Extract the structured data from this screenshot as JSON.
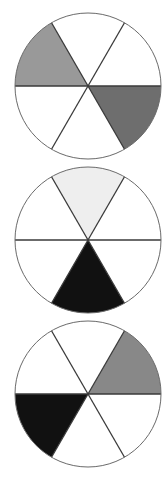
{
  "diagram": {
    "type": "sector-wheels",
    "sectors_per_wheel": 6,
    "sector_order_note": "sectors indexed clockwise starting at the 0-60deg wedge above the right horizontal radius (angles measured counter-clockwise from +x)",
    "stroke_color": "#3a3a3a",
    "outline_color": "#6a6a6a",
    "wheels": [
      {
        "id": "wheel-1",
        "center": [
          88,
          86
        ],
        "radius": 73,
        "sectors": [
          {
            "start": 0,
            "end": 60,
            "fill": "#ffffff"
          },
          {
            "start": 60,
            "end": 120,
            "fill": "#ffffff"
          },
          {
            "start": 120,
            "end": 180,
            "fill": "#999999"
          },
          {
            "start": 180,
            "end": 240,
            "fill": "#ffffff"
          },
          {
            "start": 240,
            "end": 300,
            "fill": "#ffffff"
          },
          {
            "start": 300,
            "end": 360,
            "fill": "#6e6e6e"
          }
        ]
      },
      {
        "id": "wheel-2",
        "center": [
          88,
          240
        ],
        "radius": 73,
        "sectors": [
          {
            "start": 0,
            "end": 60,
            "fill": "#ffffff"
          },
          {
            "start": 60,
            "end": 120,
            "fill": "#eeeeee"
          },
          {
            "start": 120,
            "end": 180,
            "fill": "#ffffff"
          },
          {
            "start": 180,
            "end": 240,
            "fill": "#ffffff"
          },
          {
            "start": 240,
            "end": 300,
            "fill": "#111111"
          },
          {
            "start": 300,
            "end": 360,
            "fill": "#ffffff"
          }
        ]
      },
      {
        "id": "wheel-3",
        "center": [
          88,
          394
        ],
        "radius": 73,
        "sectors": [
          {
            "start": 0,
            "end": 60,
            "fill": "#888888"
          },
          {
            "start": 60,
            "end": 120,
            "fill": "#ffffff"
          },
          {
            "start": 120,
            "end": 180,
            "fill": "#ffffff"
          },
          {
            "start": 180,
            "end": 240,
            "fill": "#111111"
          },
          {
            "start": 240,
            "end": 300,
            "fill": "#ffffff"
          },
          {
            "start": 300,
            "end": 360,
            "fill": "#ffffff"
          }
        ]
      }
    ]
  }
}
